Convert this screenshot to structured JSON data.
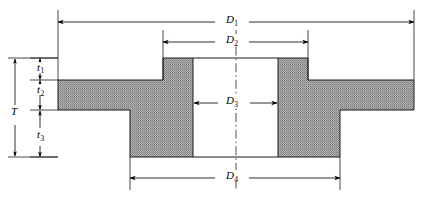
{
  "figure": {
    "name": "flange-cross-section",
    "background_color": "#ffffff",
    "line_color": "#000000",
    "hatch_fill_color": "#9a9a9a",
    "hatch_pattern": "dotted-gray-section-fill"
  },
  "dimensions": {
    "diameters": [
      {
        "id": "D1",
        "label": "D",
        "subscript": "1",
        "kind": "outer-flange-diameter",
        "label_x": 230,
        "label_y": 15,
        "line_y": 22,
        "left_x": 58,
        "right_x": 414,
        "arrow_direction": "inward-both",
        "extension_top_y": 10,
        "extension_bottom_y": 80
      },
      {
        "id": "D2",
        "label": "D",
        "subscript": "2",
        "kind": "hub-outer-diameter",
        "label_x": 230,
        "label_y": 35,
        "line_y": 42,
        "left_x": 163,
        "right_x": 308,
        "arrow_direction": "inward-both",
        "extension_top_y": 30,
        "extension_bottom_y": 58
      },
      {
        "id": "D3",
        "label": "D",
        "subscript": "3",
        "kind": "bore-diameter",
        "label_x": 230,
        "label_y": 96,
        "line_y": 103,
        "left_x": 193,
        "right_x": 278,
        "arrow_direction": "outward-both"
      },
      {
        "id": "D4",
        "label": "D",
        "subscript": "4",
        "kind": "hub-base-diameter",
        "label_x": 230,
        "label_y": 171,
        "line_y": 178,
        "left_x": 130,
        "right_x": 340,
        "arrow_direction": "inward-both",
        "extension_top_y": 157,
        "extension_bottom_y": 190
      }
    ],
    "thicknesses": [
      {
        "id": "T",
        "label": "T",
        "subscript": "",
        "kind": "overall-thickness",
        "label_x": 13,
        "label_y": 112,
        "line_x": 15,
        "top_y": 58,
        "bottom_y": 157,
        "arrow_direction": "outward-both",
        "extension_left_x": 8,
        "extension_right_x": 58
      },
      {
        "id": "t1",
        "label": "t",
        "subscript": "1",
        "kind": "upper-hub-step-thickness",
        "label_x": 38,
        "label_y": 65,
        "line_x": 40,
        "top_y": 58,
        "bottom_y": 80,
        "arrow_direction": "outward-both",
        "extension_left_x": 30,
        "extension_right_x": 58
      },
      {
        "id": "t2",
        "label": "t",
        "subscript": "2",
        "kind": "flange-web-thickness",
        "label_x": 38,
        "label_y": 88,
        "line_x": 40,
        "top_y": 80,
        "bottom_y": 110,
        "arrow_direction": "outward-both",
        "extension_left_x": 30,
        "extension_right_x": 58
      },
      {
        "id": "t3",
        "label": "t",
        "subscript": "3",
        "kind": "lower-hub-thickness",
        "label_x": 38,
        "label_y": 136,
        "line_x": 40,
        "top_y": 110,
        "bottom_y": 157,
        "arrow_direction": "outward-both",
        "extension_left_x": 30,
        "extension_right_x": 58
      }
    ]
  },
  "geometry": {
    "centerline": {
      "x": 236,
      "top_y": 30,
      "bottom_y": 190,
      "style": "dash-dot"
    },
    "bore": {
      "left_x": 193,
      "right_x": 278,
      "top_y": 58,
      "bottom_y": 157
    },
    "flange_web": {
      "left_x": 58,
      "right_x": 414,
      "top_y": 80,
      "bottom_y": 110
    },
    "hub_upper": {
      "left_x": 163,
      "right_x": 308,
      "top_y": 58,
      "bottom_y": 80
    },
    "hub_lower": {
      "left_x": 130,
      "right_x": 340,
      "top_y": 110,
      "bottom_y": 157
    },
    "section_outline_left": "58,80 163,80 163,58 193,58 193,157 130,157 130,110 58,110",
    "section_outline_right": "414,80 308,80 308,58 278,58 278,157 340,157 340,110 414,110"
  }
}
